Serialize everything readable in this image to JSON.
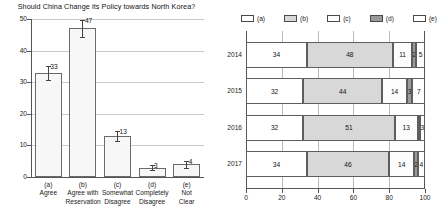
{
  "chart_data": [
    {
      "type": "bar",
      "title": "Should China Change its Policy towards North Korea?",
      "xlabel": "",
      "ylabel": "",
      "ylim": [
        0,
        50
      ],
      "yticks": [
        0,
        10,
        20,
        30,
        40,
        50
      ],
      "grid": true,
      "categories": [
        "(a)",
        "(b)",
        "(c)",
        "(d)",
        "(e)"
      ],
      "category_labels": [
        [
          "(a)",
          "Agree",
          ""
        ],
        [
          "(b)",
          "Agree with",
          "Reservation"
        ],
        [
          "(c)",
          "Somewhat",
          "Disagree"
        ],
        [
          "(d)",
          "Completely",
          "Disagree"
        ],
        [
          "(e)",
          "Not",
          "Clear"
        ]
      ],
      "values": [
        33,
        47,
        13,
        3,
        4
      ],
      "value_labels": [
        "33",
        "47",
        "13",
        "3",
        "4"
      ],
      "errors": [
        2.2,
        2.6,
        1.6,
        0.9,
        1.0
      ],
      "bar_fill": "#f7f7f7",
      "bar_edge": "#6a6a6a"
    },
    {
      "type": "bar",
      "orientation": "horizontal",
      "stacked": true,
      "title": "",
      "xlabel": "",
      "ylabel": "",
      "xlim": [
        0,
        100
      ],
      "xticks": [
        0,
        20,
        40,
        60,
        80,
        100
      ],
      "xtick_labels": [
        "0",
        "20",
        "40",
        "60",
        "80",
        "100"
      ],
      "grid": true,
      "legend_position": "top",
      "categories": [
        "2014",
        "2015",
        "2016",
        "2017"
      ],
      "series": [
        {
          "name": "(a)",
          "color": "#ffffff",
          "values": [
            34,
            32,
            32,
            34
          ]
        },
        {
          "name": "(b)",
          "color": "#d8d8d8",
          "values": [
            48,
            44,
            51,
            46
          ]
        },
        {
          "name": "(c)",
          "color": "#fcfcfc",
          "values": [
            11,
            14,
            13,
            14
          ]
        },
        {
          "name": "(d)",
          "color": "#9a9a9a",
          "values": [
            2,
            3,
            1,
            2
          ]
        },
        {
          "name": "(e)",
          "color": "#ffffff",
          "values": [
            5,
            7,
            3,
            4
          ]
        }
      ],
      "data_labels": [
        [
          "34",
          "48",
          "11",
          "2",
          "5"
        ],
        [
          "32",
          "44",
          "14",
          "3",
          "7"
        ],
        [
          "32",
          "51",
          "13",
          "1",
          "3"
        ],
        [
          "34",
          "46",
          "14",
          "2",
          "4"
        ]
      ]
    }
  ],
  "left": {
    "title": "Should China Change its Policy towards North Korea?"
  },
  "right": {
    "legend": [
      {
        "label": "(a)"
      },
      {
        "label": "(b)"
      },
      {
        "label": "(c)"
      },
      {
        "label": "(d)"
      },
      {
        "label": "(e)"
      }
    ]
  }
}
